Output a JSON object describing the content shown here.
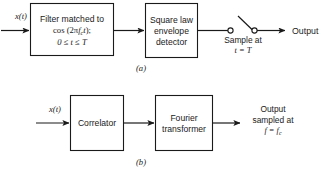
{
  "figure": {
    "width": 332,
    "height": 178,
    "background": "#ffffff",
    "line_color": "#1a1a1a",
    "text_color": "#1a1a1a"
  },
  "diagram_a": {
    "caption": "(a)",
    "input_label": "x(t)",
    "blocks": [
      {
        "name": "matched-filter",
        "line1": "Filter matched to",
        "line2_prefix": "cos (2",
        "line2_pi": "π",
        "line2_f": "f",
        "line2_fsub": "c",
        "line2_t": "t",
        "line2_suffix": ");",
        "line3": "0 ≤ t ≤ T"
      },
      {
        "name": "square-law-envelope-detector",
        "line1": "Square law",
        "line2": "envelope",
        "line3": "detector"
      }
    ],
    "switch": {
      "note_line1": "Sample at",
      "note_line2": "t = T"
    },
    "output_label": "Output"
  },
  "diagram_b": {
    "caption": "(b)",
    "input_label": "x(t)",
    "blocks": [
      {
        "name": "correlator",
        "line1": "Correlator"
      },
      {
        "name": "fourier-transformer",
        "line1": "Fourier",
        "line2": "transformer"
      }
    ],
    "output": {
      "line1": "Output",
      "line2": "sampled at",
      "line3": "f = f",
      "line3_sub": "c"
    }
  }
}
